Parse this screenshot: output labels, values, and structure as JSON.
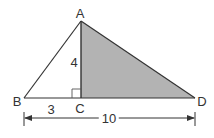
{
  "diagram": {
    "type": "geometry-triangle",
    "points": {
      "A": {
        "label": "A",
        "x": 81,
        "y": 21
      },
      "B": {
        "label": "B",
        "x": 24,
        "y": 98
      },
      "C": {
        "label": "C",
        "x": 81,
        "y": 98
      },
      "D": {
        "label": "D",
        "x": 195,
        "y": 98
      }
    },
    "segments": {
      "BC": {
        "label": "3"
      },
      "AC": {
        "label": "4"
      },
      "BD": {
        "label": "10"
      }
    },
    "shaded_region": "triangle ACD",
    "right_angle_at": "C",
    "colors": {
      "stroke": "#333333",
      "shade": "#b3b3b3",
      "background": "#ffffff"
    }
  }
}
